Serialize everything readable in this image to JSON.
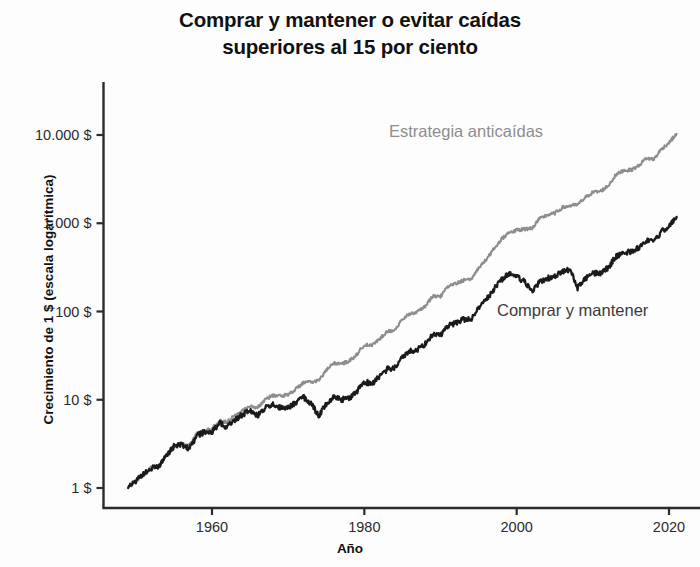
{
  "chart_data": {
    "type": "line",
    "title": "Comprar y mantener o evitar caídas\nsuperiores al 15 por ciento",
    "xlabel": "Año",
    "ylabel": "Crecimiento de 1 $ (escala logarítmica)",
    "yscale": "log",
    "xlim": [
      1949,
      2021
    ],
    "ylim": [
      1,
      30000
    ],
    "grid": false,
    "legend_position": "inline-annotations",
    "ytick_labels": [
      "10.000 $",
      "1.000 $",
      "100 $",
      "10 $",
      "1 $"
    ],
    "ytick_values": [
      10000,
      1000,
      100,
      10,
      1
    ],
    "xtick_labels": [
      "1960",
      "1980",
      "2000",
      "2020"
    ],
    "xtick_values": [
      1960,
      1980,
      2000,
      2020
    ],
    "colors": {
      "buy_and_hold": "#1a1a1a",
      "anticaidas": "#8d8d8d",
      "axis": "#2b2b2b",
      "background": "#fdfdfd"
    },
    "series": [
      {
        "name": "Estrategia anticaídas",
        "color": "#8d8d8d",
        "label_text": "Estrategia anticaídas",
        "x": [
          1949,
          1950,
          1951,
          1952,
          1953,
          1954,
          1955,
          1956,
          1957,
          1958,
          1959,
          1960,
          1961,
          1962,
          1963,
          1964,
          1965,
          1966,
          1967,
          1968,
          1969,
          1970,
          1971,
          1972,
          1973,
          1974,
          1975,
          1976,
          1977,
          1978,
          1979,
          1980,
          1981,
          1982,
          1983,
          1984,
          1985,
          1986,
          1987,
          1988,
          1989,
          1990,
          1991,
          1992,
          1993,
          1994,
          1995,
          1996,
          1997,
          1998,
          1999,
          2000,
          2001,
          2002,
          2003,
          2004,
          2005,
          2006,
          2007,
          2008,
          2009,
          2010,
          2011,
          2012,
          2013,
          2014,
          2015,
          2016,
          2017,
          2018,
          2019,
          2020,
          2021
        ],
        "values": [
          1,
          1.2,
          1.45,
          1.68,
          1.72,
          2.35,
          2.95,
          3.2,
          3.05,
          4.1,
          4.5,
          4.7,
          5.8,
          5.6,
          6.7,
          7.7,
          8.4,
          8.2,
          10.1,
          11.2,
          11.0,
          11.5,
          13.2,
          15.6,
          15.9,
          16.5,
          21.5,
          26.0,
          25.5,
          27.5,
          32.5,
          42.0,
          41.0,
          49.0,
          59.5,
          62.0,
          81.0,
          95.0,
          99.0,
          115.0,
          150.0,
          148.0,
          192.0,
          206.0,
          226.0,
          229.0,
          314.0,
          385.0,
          512.0,
          658.0,
          795.0,
          830.0,
          860.0,
          880.0,
          1120.0,
          1240.0,
          1300.0,
          1500.0,
          1580.0,
          1620.0,
          1950.0,
          2250.0,
          2300.0,
          2650.0,
          3500.0,
          3980.0,
          4000.0,
          4480.0,
          5450.0,
          5300.0,
          6900.0,
          8200.0,
          10300.0
        ],
        "endpoint_value_approx": 20000,
        "start_value": 1
      },
      {
        "name": "Comprar y mantener",
        "color": "#1a1a1a",
        "label_text": "Comprar y mantener",
        "x": [
          1949,
          1950,
          1951,
          1952,
          1953,
          1954,
          1955,
          1956,
          1957,
          1958,
          1959,
          1960,
          1961,
          1962,
          1963,
          1964,
          1965,
          1966,
          1967,
          1968,
          1969,
          1970,
          1971,
          1972,
          1973,
          1974,
          1975,
          1976,
          1977,
          1978,
          1979,
          1980,
          1981,
          1982,
          1983,
          1984,
          1985,
          1986,
          1987,
          1988,
          1989,
          1990,
          1991,
          1992,
          1993,
          1994,
          1995,
          1996,
          1997,
          1998,
          1999,
          2000,
          2001,
          2002,
          2003,
          2004,
          2005,
          2006,
          2007,
          2008,
          2009,
          2010,
          2011,
          2012,
          2013,
          2014,
          2015,
          2016,
          2017,
          2018,
          2019,
          2020,
          2021
        ],
        "values": [
          1,
          1.2,
          1.45,
          1.68,
          1.72,
          2.35,
          2.95,
          3.1,
          2.75,
          3.9,
          4.3,
          4.3,
          5.4,
          4.9,
          5.9,
          6.8,
          7.5,
          6.6,
          8.1,
          8.9,
          8.0,
          8.2,
          9.2,
          10.8,
          9.1,
          6.6,
          8.9,
          10.9,
          10.0,
          10.5,
          12.3,
          16.0,
          15.2,
          18.3,
          22.2,
          23.3,
          30.5,
          35.5,
          37.0,
          42.8,
          55.5,
          53.5,
          69.0,
          74.0,
          81.0,
          81.5,
          111.0,
          135.0,
          178.0,
          228.0,
          274.0,
          248.0,
          218.0,
          168.0,
          215.0,
          237.0,
          247.0,
          284.0,
          298.0,
          186.0,
          234.0,
          268.0,
          272.0,
          314.0,
          414.0,
          469.0,
          472.0,
          528.0,
          640.0,
          610.0,
          798.0,
          940.0,
          1180.0
        ],
        "endpoint_value_approx": 2200,
        "start_value": 1
      }
    ]
  }
}
